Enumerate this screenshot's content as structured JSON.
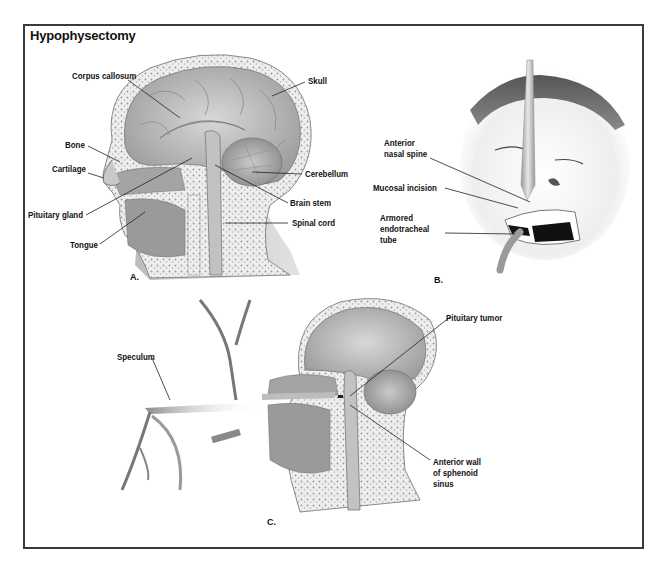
{
  "figure": {
    "title": "Hypophysectomy",
    "colors": {
      "frame": "#3a3a3a",
      "tissue_light": "#d9d9d9",
      "tissue_mid": "#a9a9a9",
      "tissue_dark": "#7a7a7a",
      "bone_speckle": "#e6e6e6",
      "label_text": "#111111"
    },
    "panels": [
      {
        "id": "A",
        "caption": "A.",
        "description": "Sagittal cross-section of head",
        "labels": [
          {
            "text": "Corpus callosum"
          },
          {
            "text": "Skull"
          },
          {
            "text": "Bone"
          },
          {
            "text": "Cartilage"
          },
          {
            "text": "Cerebellum"
          },
          {
            "text": "Brain stem"
          },
          {
            "text": "Pituitary gland"
          },
          {
            "text": "Spinal cord"
          },
          {
            "text": "Tongue"
          }
        ]
      },
      {
        "id": "B",
        "caption": "B.",
        "description": "Face with instrument inserted under upper lip",
        "labels": [
          {
            "text": "Anterior",
            "text2": "nasal spine"
          },
          {
            "text": "Mucosal incision"
          },
          {
            "text": "Armored",
            "text2": "endotracheal",
            "text3": "tube"
          }
        ]
      },
      {
        "id": "C",
        "caption": "C.",
        "description": "Speculum inserted transsphenoidally to reach pituitary tumor",
        "labels": [
          {
            "text": "Speculum"
          },
          {
            "text": "Pituitary tumor"
          },
          {
            "text": "Anterior wall",
            "text2": "of sphenoid",
            "text3": "sinus"
          }
        ]
      }
    ]
  }
}
